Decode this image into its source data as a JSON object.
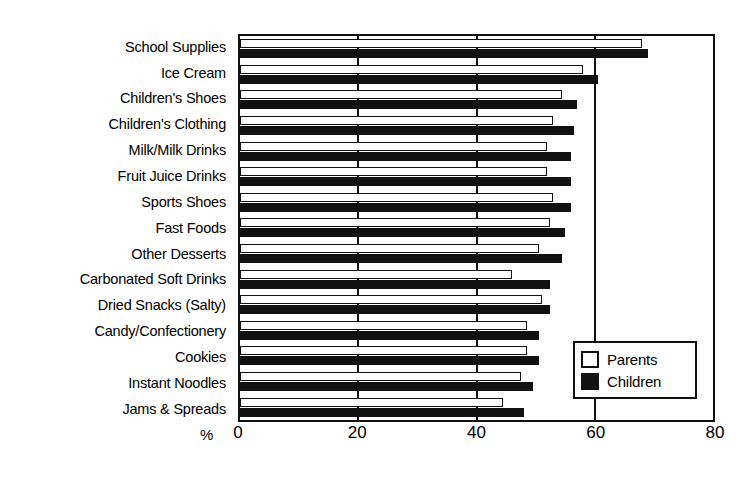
{
  "chart_data": {
    "type": "bar",
    "orientation": "horizontal",
    "title": "",
    "subtitle": "",
    "xlabel": "%",
    "ylabel": "",
    "xlim": [
      0,
      80
    ],
    "xticks": [
      0,
      20,
      40,
      60,
      80
    ],
    "xtick_labels": [
      "0",
      "20",
      "40",
      "60",
      "80"
    ],
    "grid": true,
    "grid_axis": "x",
    "legend_position": "inside-bottom-right",
    "categories": [
      "School Supplies",
      "Ice Cream",
      "Children's Shoes",
      "Children's Clothing",
      "Milk/Milk Drinks",
      "Fruit Juice Drinks",
      "Sports Shoes",
      "Fast Foods",
      "Other Desserts",
      "Carbonated Soft Drinks",
      "Dried Snacks (Salty)",
      "Candy/Confectionery",
      "Cookies",
      "Instant Noodles",
      "Jams & Spreads"
    ],
    "series": [
      {
        "name": "Parents",
        "color": "#ffffff",
        "edge_color": "#111111",
        "values": [
          68,
          58,
          54.5,
          53,
          52,
          52,
          53,
          52.5,
          50.5,
          46,
          51,
          48.5,
          48.5,
          47.5,
          44.5
        ]
      },
      {
        "name": "Children",
        "color": "#111111",
        "edge_color": "#111111",
        "values": [
          69,
          60.5,
          57,
          56.5,
          56,
          56,
          56,
          55,
          54.5,
          52.5,
          52.5,
          50.5,
          50.5,
          49.5,
          48
        ]
      }
    ]
  },
  "legend": {
    "entries": [
      {
        "label": "Parents",
        "swatch": "hollow-square"
      },
      {
        "label": "Children",
        "swatch": "filled-square"
      }
    ]
  },
  "axis": {
    "unit_label": "%"
  },
  "colors": {
    "ink": "#111111",
    "paper": "#ffffff"
  }
}
